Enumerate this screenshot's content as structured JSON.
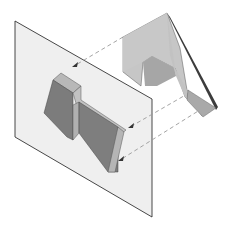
{
  "diagram": {
    "type": "orthographic-projection-illustration",
    "colors": {
      "background": "#ffffff",
      "plane_fill": "#eeeeee",
      "plane_edge": "#333333",
      "object_light": "#c4c4c4",
      "object_mid": "#a9a9a9",
      "object_dark": "#8a8a8a",
      "object_edge_dark": "#444444",
      "projection_dark": "#7e7e7e",
      "projection_side": "#b5b5b5",
      "dashed_line": "#9a9a9a",
      "arrow": "#333333"
    },
    "elements": {
      "projection_plane": "Projection plane",
      "object": "L-shaped solid",
      "projected_view": "Projected view",
      "projection_lines": 3
    }
  }
}
